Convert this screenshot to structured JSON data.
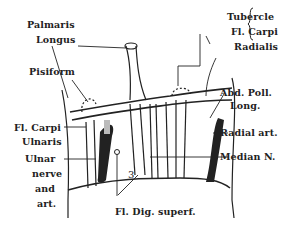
{
  "diagram": {
    "labels": {
      "palmaris_longus_1": "Palmaris",
      "palmaris_longus_2": "Longus",
      "pisiform": "Pisiform",
      "tubercle_1": "Tubercle",
      "tubercle_2": "Fl. Carpi",
      "tubercle_3": "Radialis",
      "abd_poll_1": "Abd. Poll.",
      "abd_poll_2": "Long.",
      "fcu_1": "Fl. Carpi",
      "fcu_2": "Ulnaris",
      "ulnar_1": "Ulnar",
      "ulnar_2": "nerve",
      "ulnar_3": "and",
      "ulnar_4": "art.",
      "radial_art": "Radial art.",
      "median_n": "Median N.",
      "fl_dig": "Fl. Dig. superf.",
      "number_3": "3"
    },
    "colors": {
      "ink": "#222222",
      "background": "#ffffff",
      "shade": "#bbbbbb"
    }
  }
}
